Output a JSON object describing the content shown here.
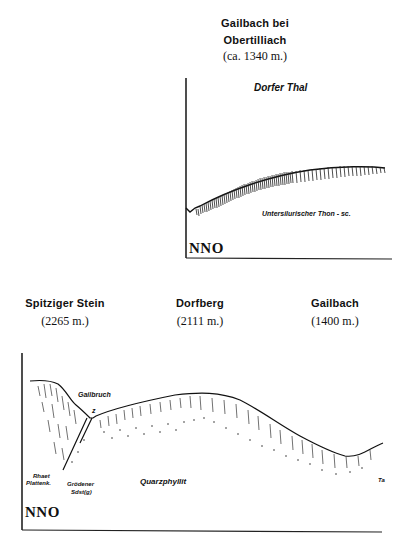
{
  "top_profile": {
    "peak": {
      "name_line1": "Gailbach bei",
      "name_line2": "Obertilliach",
      "elevation": "(ca. 1340 m.)"
    },
    "valley_label": "Dorfer Thal",
    "rock_label": "Untersilurischer Thon - sc.",
    "orientation": "NNO"
  },
  "bottom_profile": {
    "peaks": [
      {
        "name": "Spitziger Stein",
        "elevation": "(2265 m.)"
      },
      {
        "name": "Dorfberg",
        "elevation": "(2111 m.)"
      },
      {
        "name": "Gailbach",
        "elevation": "(1400 m.)"
      }
    ],
    "labels": {
      "gailbruch": "Gailbruch",
      "z_mark": "z",
      "rhaet_line1": "Rhaet",
      "rhaet_line2": "Plattenk.",
      "groedener_line1": "Grödener",
      "groedener_line2": "Sdst(g)",
      "quarzphyllit": "Quarzphyllit",
      "edge_mark": "Ta"
    },
    "orientation": "NNO"
  }
}
